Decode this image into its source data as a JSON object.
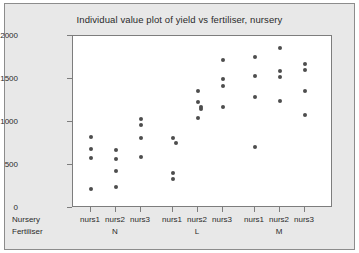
{
  "chart_data": {
    "type": "scatter",
    "title": "Individual value plot of yield vs fertiliser, nursery",
    "xlabel": "",
    "ylabel": "Yield",
    "ylim": [
      0,
      2000
    ],
    "yticks": [
      0,
      500,
      1000,
      1500,
      2000
    ],
    "grid": false,
    "legend": false,
    "row_headers": {
      "nursery": "Nursery",
      "fertiliser": "Fertiliser"
    },
    "group_labels": [
      "N",
      "L",
      "M"
    ],
    "categories": [
      "nurs1",
      "nurs2",
      "nurs3",
      "nurs1",
      "nurs2",
      "nurs3",
      "nurs1",
      "nurs2",
      "nurs3"
    ],
    "groups": [
      {
        "fertiliser": "N",
        "nurseries": [
          {
            "name": "nurs1",
            "values": [
              820,
              690,
              580,
              220
            ]
          },
          {
            "name": "nurs2",
            "values": [
              680,
              565,
              425,
              240
            ]
          },
          {
            "name": "nurs3",
            "values": [
              1030,
              965,
              810,
              595
            ]
          }
        ]
      },
      {
        "fertiliser": "L",
        "nurseries": [
          {
            "name": "nurs1",
            "values": [
              810,
              760,
              410,
              340
            ]
          },
          {
            "name": "nurs2",
            "values": [
              1360,
              1230,
              1175,
              1150,
              1050
            ]
          },
          {
            "name": "nurs3",
            "values": [
              1720,
              1500,
              1415,
              1170
            ]
          }
        ]
      },
      {
        "fertiliser": "M",
        "nurseries": [
          {
            "name": "nurs1",
            "values": [
              1760,
              1535,
              1290,
              715
            ]
          },
          {
            "name": "nurs2",
            "values": [
              1855,
              1590,
              1520,
              1250
            ]
          },
          {
            "name": "nurs3",
            "values": [
              1670,
              1605,
              1360,
              1085
            ]
          }
        ]
      }
    ],
    "colors": {
      "marker": "#4d4d4d",
      "panel_background": "#ffffff",
      "figure_background": "#e8e8e8",
      "axis": "#7d7d7d",
      "text": "#2b2b2b"
    }
  }
}
